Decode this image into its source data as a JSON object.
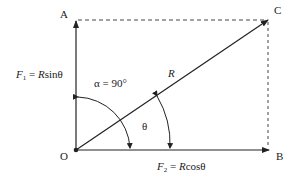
{
  "diagram": {
    "type": "vector-resolution",
    "colors": {
      "stroke": "#222222",
      "dashed": "#444444",
      "background": "#ffffff"
    },
    "points": {
      "O": {
        "label": "O"
      },
      "A": {
        "label": "A"
      },
      "B": {
        "label": "B"
      },
      "C": {
        "label": "C"
      }
    },
    "vectors": {
      "resultant": {
        "label": "R",
        "from": "O",
        "to": "C"
      },
      "vertical": {
        "from": "O",
        "to": "A"
      },
      "horizontal": {
        "from": "O",
        "to": "B"
      }
    },
    "labels": {
      "f1": {
        "symbol": "F",
        "subscript": "1",
        "equals": " = ",
        "expr_var": "R",
        "expr_fn": "sinθ"
      },
      "f2": {
        "symbol": "F",
        "subscript": "2",
        "equals": " = ",
        "expr_var": "R",
        "expr_fn": "cosθ"
      },
      "alpha": "α = 90°",
      "theta": "θ",
      "r": "R"
    }
  }
}
